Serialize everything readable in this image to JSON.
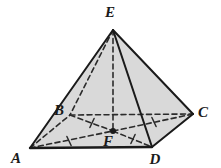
{
  "figure": {
    "name": "square-pyramid",
    "background_color": "#ffffff",
    "face_fill_color": "#d9d9d9",
    "face_fill_color_dark": "#cccccc",
    "edge_color": "#1a1a1a",
    "hidden_edge_color": "#2b2b2b",
    "label_color": "#1a1a1a"
  },
  "vertices": [
    {
      "id": "E",
      "label": "E",
      "x": 113,
      "y": 30,
      "label_x": 110,
      "label_y": 17,
      "role": "apex",
      "marked": false
    },
    {
      "id": "A",
      "label": "A",
      "x": 30,
      "y": 148,
      "label_x": 16,
      "label_y": 163,
      "role": "base-corner",
      "marked": false
    },
    {
      "id": "B",
      "label": "B",
      "x": 70,
      "y": 115,
      "label_x": 59,
      "label_y": 115,
      "role": "base-corner",
      "marked": false
    },
    {
      "id": "C",
      "label": "C",
      "x": 193,
      "y": 114,
      "label_x": 203,
      "label_y": 117,
      "role": "base-corner",
      "marked": false
    },
    {
      "id": "D",
      "label": "D",
      "x": 152,
      "y": 147,
      "label_x": 155,
      "label_y": 164,
      "role": "base-corner",
      "marked": false
    },
    {
      "id": "F",
      "label": "F",
      "x": 113,
      "y": 131,
      "label_x": 108,
      "label_y": 146,
      "role": "base-center",
      "marked": true
    }
  ],
  "edges": [
    {
      "id": "EA",
      "from": "E",
      "to": "A",
      "style": "solid",
      "hidden": false,
      "width": 2.0
    },
    {
      "id": "ED",
      "from": "E",
      "to": "D",
      "style": "solid",
      "hidden": false,
      "width": 2.0
    },
    {
      "id": "EC",
      "from": "E",
      "to": "C",
      "style": "solid",
      "hidden": false,
      "width": 2.0
    },
    {
      "id": "EB",
      "from": "E",
      "to": "B",
      "style": "dashed",
      "hidden": true,
      "width": 1.6
    },
    {
      "id": "AD",
      "from": "A",
      "to": "D",
      "style": "solid",
      "hidden": false,
      "width": 2.4
    },
    {
      "id": "DC",
      "from": "D",
      "to": "C",
      "style": "solid",
      "hidden": false,
      "width": 2.0
    },
    {
      "id": "AB",
      "from": "A",
      "to": "B",
      "style": "dashed",
      "hidden": true,
      "width": 1.6
    },
    {
      "id": "BC",
      "from": "B",
      "to": "C",
      "style": "dashed",
      "hidden": true,
      "width": 1.6
    },
    {
      "id": "EF",
      "from": "E",
      "to": "F",
      "style": "dashed",
      "hidden": true,
      "width": 1.6,
      "note": "altitude"
    },
    {
      "id": "AF",
      "from": "A",
      "to": "F",
      "style": "dashed",
      "hidden": true,
      "width": 1.6,
      "note": "half-diagonal",
      "tick_marks": 1
    },
    {
      "id": "FC",
      "from": "F",
      "to": "C",
      "style": "dashed",
      "hidden": true,
      "width": 1.6,
      "note": "half-diagonal",
      "tick_marks": 1
    },
    {
      "id": "BF",
      "from": "B",
      "to": "F",
      "style": "dashed",
      "hidden": true,
      "width": 1.6,
      "note": "half-diagonal",
      "tick_marks": 1
    },
    {
      "id": "FD",
      "from": "F",
      "to": "D",
      "style": "dashed",
      "hidden": true,
      "width": 1.6,
      "note": "half-diagonal",
      "tick_marks": 1
    }
  ],
  "faces": [
    {
      "id": "EAD",
      "vertices": [
        "E",
        "A",
        "D"
      ],
      "shade": "light",
      "visible": true
    },
    {
      "id": "EDC",
      "vertices": [
        "E",
        "D",
        "C"
      ],
      "shade": "light",
      "visible": true
    },
    {
      "id": "ADC",
      "vertices": [
        "A",
        "D",
        "C"
      ],
      "shade": "light",
      "visible": true
    },
    {
      "id": "ABC",
      "vertices": [
        "A",
        "B",
        "C"
      ],
      "shade": "light",
      "visible": false
    }
  ],
  "congruence_ticks": [
    {
      "on_edge": "AF",
      "x": 69,
      "y": 141,
      "angle": 65
    },
    {
      "on_edge": "FC",
      "x": 154,
      "y": 122,
      "angle": 65
    },
    {
      "on_edge": "BF",
      "x": 92,
      "y": 123,
      "angle": 115
    },
    {
      "on_edge": "FD",
      "x": 133,
      "y": 139,
      "angle": 115
    }
  ]
}
